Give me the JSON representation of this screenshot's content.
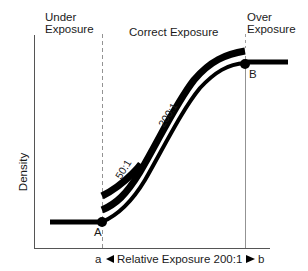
{
  "regions": {
    "under": [
      "Under",
      "Exposure"
    ],
    "correct": "Correct Exposure",
    "over": [
      "Over",
      "Exposure"
    ]
  },
  "axes": {
    "y_label": "Density",
    "x_label_left": "a",
    "x_label_center": "Relative Exposure 200:1",
    "x_label_right": "b"
  },
  "points": {
    "a": "A",
    "b": "B"
  },
  "curves": {
    "c50": "50:1",
    "c200": "200:1"
  },
  "colors": {
    "ink": "#000000",
    "axis": "#555555",
    "background": "#ffffff"
  }
}
